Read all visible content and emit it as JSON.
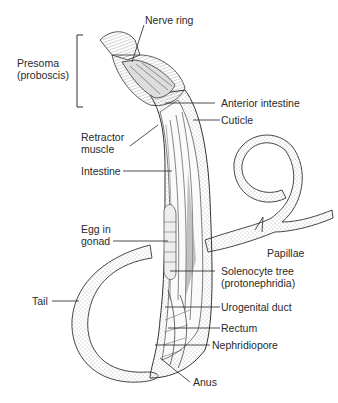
{
  "figure": {
    "colors": {
      "ink": "#2a2a2a",
      "stipple": "#7a7a7a",
      "background": "#ffffff"
    }
  },
  "labels": {
    "nerve_ring": "Nerve ring",
    "presoma": "Presoma\n(proboscis)",
    "anterior_intestine": "Anterior intestine",
    "cuticle": "Cuticle",
    "retractor_muscle": "Retractor\nmuscle",
    "intestine": "Intestine",
    "egg_in_gonad": "Egg in\ngonad",
    "papillae": "Papillae",
    "solenocyte_tree": "Solenocyte tree\n(protonephridia)",
    "tail": "Tail",
    "urogenital_duct": "Urogenital duct",
    "rectum": "Rectum",
    "nephridiopore": "Nephridiopore",
    "anus": "Anus"
  }
}
